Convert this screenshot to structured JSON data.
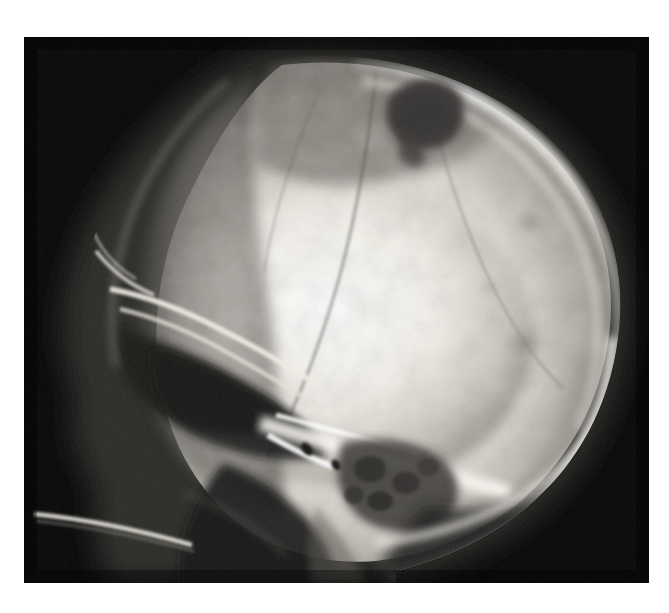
{
  "image": {
    "kind": "radiograph",
    "modality": "X-ray",
    "view": "lateral skull",
    "title": "Lateral skull radiograph",
    "width": 669,
    "height": 613,
    "background_color": "#ffffff",
    "film_color": "#050505",
    "film": {
      "x": 24,
      "y": 37,
      "width": 625,
      "height": 546
    }
  },
  "palette": {
    "background": "#ffffff",
    "film_black": "#050505",
    "bone_bright": "#f6f4ef",
    "bone_mid": "#c9c5bd",
    "bone_dim": "#8e8b85",
    "soft_tissue": "#4a4842",
    "lucency": "#3b3934",
    "marker": "#121212"
  },
  "anatomy": {
    "regions": [
      {
        "name": "cranial-vault",
        "label": "Cranial vault"
      },
      {
        "name": "frontal-bone",
        "label": "Frontal bone"
      },
      {
        "name": "parietal-bone",
        "label": "Parietal bone"
      },
      {
        "name": "occipital-bone",
        "label": "Occipital bone"
      },
      {
        "name": "orbital-roof",
        "label": "Orbital roof"
      },
      {
        "name": "frontal-sinus",
        "label": "Frontal sinus"
      },
      {
        "name": "sella-turcica",
        "label": "Sella turcica"
      },
      {
        "name": "petrous-temporal-bone",
        "label": "Petrous temporal bone"
      },
      {
        "name": "mastoid-air-cells",
        "label": "Mastoid air cells"
      },
      {
        "name": "skull-base",
        "label": "Skull base"
      },
      {
        "name": "hard-palate",
        "label": "Hard palate"
      },
      {
        "name": "cervical-spine",
        "label": "Cervical spine"
      },
      {
        "name": "mandible-ramus",
        "label": "Mandibular ramus"
      }
    ],
    "findings": [
      {
        "name": "parietal-lytic-lesion",
        "label": "Lytic lesion, high parietal",
        "cx": 425,
        "cy": 108,
        "rx": 35,
        "ry": 28
      },
      {
        "name": "posterior-lucency-upper",
        "label": "Small lucency, posterior parietal",
        "cx": 530,
        "cy": 222,
        "rx": 14,
        "ry": 11
      },
      {
        "name": "posterior-lucency-lower",
        "label": "Small lucency, posterior parietal",
        "cx": 524,
        "cy": 344,
        "rx": 17,
        "ry": 14
      },
      {
        "name": "marker-upper",
        "label": "Radiopaque marker",
        "cx": 307,
        "cy": 449,
        "rx": 4.5,
        "ry": 7,
        "rotate": -38
      },
      {
        "name": "marker-lower",
        "label": "Radiopaque marker",
        "cx": 336,
        "cy": 465,
        "rx": 4,
        "ry": 6,
        "rotate": -30
      }
    ]
  }
}
